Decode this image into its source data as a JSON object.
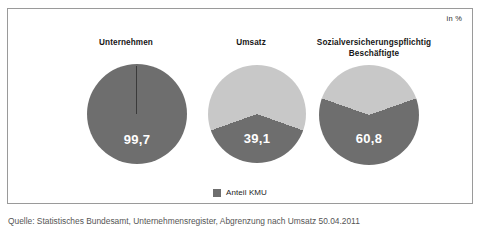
{
  "unit_label": "in %",
  "legend": {
    "swatch_color": "#6e6e6e",
    "label": "Anteil KMU"
  },
  "source_note": "Quelle: Statistisches Bundesamt, Unternehmensregister, Abgrenzung nach Umsatz 50.04.2011",
  "colors": {
    "share_kmu": "#6e6e6e",
    "remainder": "#c8c8c8",
    "frame_border": "#9a9a9a",
    "value_text": "#ffffff",
    "background": "#ffffff"
  },
  "panels": [
    {
      "title": "Unternehmen",
      "value_text": "99,7"
    },
    {
      "title": "Umsatz",
      "value_text": "39,1"
    },
    {
      "title": "Sozialversicherungspflichtig Beschäftigte",
      "title_line1": "Sozialversicherungspflichtig",
      "title_line2": "Beschäftigte",
      "value_text": "60,8"
    }
  ],
  "chart_data": {
    "type": "pie",
    "title": "",
    "subtitle": "",
    "unit": "in %",
    "legend": [
      "Anteil KMU"
    ],
    "legend_position": "bottom",
    "series_labels": [
      "Anteil KMU",
      "Übrige"
    ],
    "charts": [
      {
        "category": "Unternehmen",
        "labels": [
          "Anteil KMU",
          "Übrige"
        ],
        "values": [
          99.7,
          0.3
        ],
        "displayed_value": "99,7",
        "colors": [
          "#6e6e6e",
          "#c8c8c8"
        ]
      },
      {
        "category": "Umsatz",
        "labels": [
          "Anteil KMU",
          "Übrige"
        ],
        "values": [
          39.1,
          60.9
        ],
        "displayed_value": "39,1",
        "colors": [
          "#6e6e6e",
          "#c8c8c8"
        ]
      },
      {
        "category": "Sozialversicherungspflichtig Beschäftigte",
        "labels": [
          "Anteil KMU",
          "Übrige"
        ],
        "values": [
          60.8,
          39.2
        ],
        "displayed_value": "60,8",
        "colors": [
          "#6e6e6e",
          "#c8c8c8"
        ]
      }
    ]
  }
}
